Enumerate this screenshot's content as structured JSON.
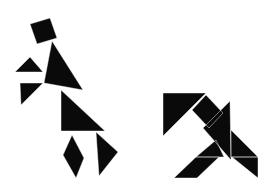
{
  "image": {
    "width": 274,
    "height": 189,
    "background": "#ffffff",
    "piece_color": "#0a0a0a"
  },
  "figures": [
    {
      "name": "dancing-person",
      "pieces": [
        {
          "id": "square-head",
          "shape": "square",
          "points": "30,24 50,18 57,38 37,44"
        },
        {
          "id": "large-triangle-torso",
          "shape": "large-triangle",
          "points": "52,41 44,83 83,90"
        },
        {
          "id": "small-triangle-arm-upper",
          "shape": "small-triangle",
          "points": "15,72 30,57 43,72"
        },
        {
          "id": "small-triangle-arm-lower",
          "shape": "small-triangle",
          "points": "20,83 43,83 21,105"
        },
        {
          "id": "large-triangle-skirt",
          "shape": "large-triangle",
          "points": "61,90 61,131 105,131"
        },
        {
          "id": "parallelogram-leg",
          "shape": "parallelogram",
          "points": "72,135 63,155 76,178 84,158"
        },
        {
          "id": "medium-triangle-leg",
          "shape": "medium-triangle",
          "points": "96,132 118,152 99,176"
        }
      ]
    },
    {
      "name": "bird-figure",
      "pieces": [
        {
          "id": "large-triangle-wing",
          "shape": "large-triangle",
          "points": "163,93 206,93 163,136"
        },
        {
          "id": "square-neck",
          "shape": "square",
          "points": "192,110 206,95 223,113 209,128"
        },
        {
          "id": "large-triangle-body",
          "shape": "large-triangle",
          "points": "230,101 203,128 231,160"
        },
        {
          "id": "medium-triangle-tail",
          "shape": "medium-triangle",
          "points": "231,130 258,157 231,157"
        },
        {
          "id": "small-triangle-tail-lower",
          "shape": "small-triangle",
          "points": "232,157 258,157 258,178"
        },
        {
          "id": "small-triangle-foot",
          "shape": "small-triangle",
          "points": "196,157 216,140 224,157"
        },
        {
          "id": "parallelogram-leg",
          "shape": "parallelogram",
          "points": "196,157 219,157 197,178 174,178"
        }
      ]
    }
  ]
}
